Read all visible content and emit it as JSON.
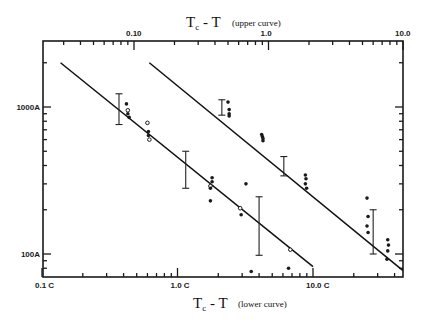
{
  "chart_data": {
    "type": "scatter",
    "title_top": "Tc - T",
    "title_top_note": "(upper curve)",
    "xlabel_bottom": "Tc - T",
    "xlabel_bottom_note": "(lower curve)",
    "ylabel": "",
    "x_scale": "log",
    "y_scale": "log",
    "grid": false,
    "legend": null,
    "top_axis": {
      "ticks": [
        0.1,
        1.0,
        10.0
      ],
      "tick_labels": [
        "0.10",
        "1.0",
        "10.0"
      ],
      "range": [
        0.05,
        10.0
      ]
    },
    "bottom_axis": {
      "ticks": [
        0.1,
        1.0,
        10.0
      ],
      "tick_labels": [
        "0.1 C",
        "1.0 C",
        "10.0 C"
      ],
      "range": [
        0.1,
        46
      ]
    },
    "y_axis": {
      "ticks": [
        100,
        1000
      ],
      "tick_labels": [
        "100A",
        "1000A"
      ],
      "range": [
        70,
        2800
      ]
    },
    "series": [
      {
        "name": "lower curve",
        "axis": "bottom",
        "fit_line": [
          [
            0.137,
            2000
          ],
          [
            10.0,
            82
          ]
        ],
        "points": [
          [
            0.42,
            1050
          ],
          [
            0.43,
            950
          ],
          [
            0.43,
            900
          ],
          [
            0.44,
            850
          ],
          [
            0.6,
            780
          ],
          [
            0.61,
            680
          ],
          [
            0.61,
            640
          ],
          [
            0.62,
            600
          ],
          [
            1.8,
            330
          ],
          [
            1.8,
            310
          ],
          [
            1.75,
            290
          ],
          [
            1.75,
            280
          ],
          [
            1.75,
            230
          ],
          [
            2.9,
            205
          ],
          [
            2.95,
            185
          ],
          [
            3.2,
            300
          ],
          [
            6.8,
            107
          ],
          [
            3.5,
            76
          ],
          [
            6.6,
            80
          ]
        ],
        "error_bars": [
          {
            "x": 0.37,
            "y": 1000,
            "low": 760,
            "high": 1230
          },
          {
            "x": 1.15,
            "y": 380,
            "low": 280,
            "high": 500
          },
          {
            "x": 4.0,
            "y": 145,
            "low": 98,
            "high": 245
          }
        ]
      },
      {
        "name": "upper curve",
        "axis": "top",
        "fit_line": [
          [
            0.13,
            2000
          ],
          [
            10.0,
            77
          ]
        ],
        "points": [
          [
            0.5,
            1080
          ],
          [
            0.51,
            960
          ],
          [
            0.51,
            900
          ],
          [
            0.51,
            870
          ],
          [
            0.89,
            650
          ],
          [
            0.9,
            630
          ],
          [
            0.91,
            610
          ],
          [
            0.91,
            590
          ],
          [
            1.88,
            345
          ],
          [
            1.9,
            325
          ],
          [
            1.88,
            300
          ],
          [
            1.92,
            280
          ],
          [
            5.4,
            240
          ],
          [
            5.5,
            180
          ],
          [
            5.4,
            155
          ],
          [
            5.5,
            140
          ],
          [
            7.7,
            125
          ],
          [
            7.8,
            115
          ],
          [
            7.7,
            105
          ],
          [
            7.6,
            92
          ]
        ],
        "error_bars": [
          {
            "x": 0.45,
            "y": 1000,
            "low": 880,
            "high": 1120
          },
          {
            "x": 1.3,
            "y": 400,
            "low": 340,
            "high": 460
          },
          {
            "x": 6.0,
            "y": 150,
            "low": 100,
            "high": 200
          }
        ]
      }
    ]
  },
  "labels": {
    "top_title_main": "T",
    "top_title_sub": "c",
    "top_title_rest": " - T",
    "top_title_note": "(upper curve)",
    "bottom_title_main": "T",
    "bottom_title_sub": "c",
    "bottom_title_rest": " - T",
    "bottom_title_note": "(lower curve)"
  }
}
